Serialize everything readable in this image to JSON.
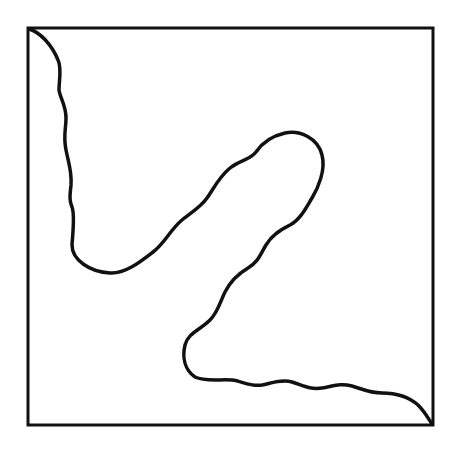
{
  "diagram": {
    "stroke_color": "#111111",
    "background_color": "#ffffff",
    "frame": {
      "x": 28,
      "y": 28,
      "width": 405,
      "height": 397
    },
    "curve_start": "top-left corner",
    "curve_end": "bottom-right corner"
  }
}
